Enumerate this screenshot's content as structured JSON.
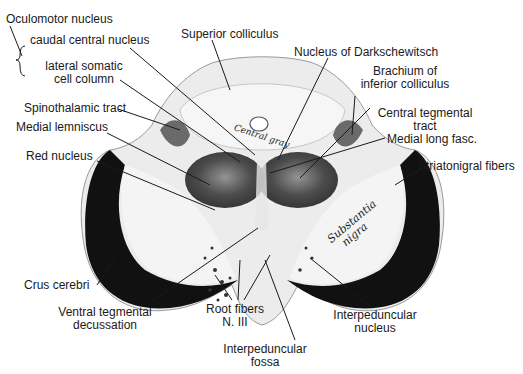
{
  "figure": {
    "inline_annotations": {
      "central_gray": "Central gray",
      "substantia_nigra_line1": "Substantia",
      "substantia_nigra_line2": "nigra"
    },
    "labels": {
      "oculomotor_nucleus": "Oculomotor nucleus",
      "caudal_central_nucleus": "caudal central nucleus",
      "lateral_somatic_line1": "lateral somatic",
      "lateral_somatic_line2": "cell column",
      "superior_colliculus": "Superior colliculus",
      "nucleus_darkschewitsch": "Nucleus of Darkschewitsch",
      "brachium_line1": "Brachium of",
      "brachium_line2": "inferior colliculus",
      "spinothalamic_tract": "Spinothalamic tract",
      "central_tegmental_line1": "Central tegmental",
      "central_tegmental_line2": "tract",
      "medial_lemniscus": "Medial lemniscus",
      "medial_long_fasc": "Medial long fasc.",
      "red_nucleus": "Red nucleus",
      "striatonigral_fibers": "Striatonigral fibers",
      "crus_cerebri": "Crus cerebri",
      "ventral_tegmental_line1": "Ventral tegmental",
      "ventral_tegmental_line2": "decussation",
      "root_fibers_line1": "Root fibers",
      "root_fibers_line2": "N. III",
      "interpeduncular_nucleus_line1": "Interpeduncular",
      "interpeduncular_nucleus_line2": "nucleus",
      "interpeduncular_fossa_line1": "Interpeduncular",
      "interpeduncular_fossa_line2": "fossa"
    }
  }
}
